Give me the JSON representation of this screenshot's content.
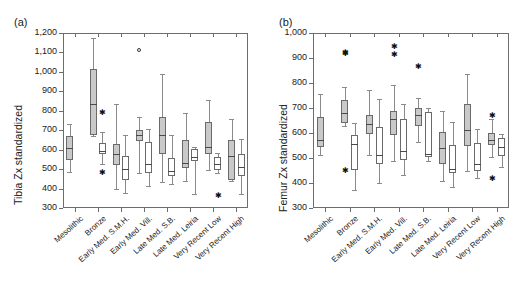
{
  "figure": {
    "panels": [
      {
        "key": "a",
        "label": "(a)",
        "ylabel": "Tibia Zx standardized",
        "ylim": [
          300,
          1200
        ],
        "yticks": [
          300,
          400,
          500,
          600,
          700,
          800,
          900,
          1000,
          1100,
          1200
        ],
        "ytick_labels": [
          "300",
          "400",
          "500",
          "600",
          "700",
          "800",
          "900",
          "1,000",
          "1,100",
          "1,200"
        ],
        "categories": [
          "Mesolithic",
          "Bronze",
          "Early Med. S.M.H.",
          "Early Med. Vill.",
          "Late Med. S.B.",
          "Late Med. Leiria",
          "Very Recent Low",
          "Very Recent High"
        ]
      },
      {
        "key": "b",
        "label": "(b)",
        "ylabel": "Femur Zx standardized",
        "ylim": [
          300,
          1000
        ],
        "yticks": [
          300,
          400,
          500,
          600,
          700,
          800,
          900,
          1000
        ],
        "ytick_labels": [
          "300",
          "400",
          "500",
          "600",
          "700",
          "800",
          "900",
          "1,000"
        ],
        "categories": [
          "Mesolithic",
          "Bronze",
          "Early Med. S.M.H.",
          "Early Med. Vill.",
          "Late Med. S.B.",
          "Late Med. Leiria",
          "Very Recent Low",
          "Very Recent High"
        ]
      }
    ]
  },
  "chart_data": [
    {
      "type": "box",
      "panel": "a",
      "title": "(a)",
      "ylabel": "Tibia Zx standardized",
      "xlabel": "",
      "ylim": [
        300,
        1200
      ],
      "yticks": [
        300,
        400,
        500,
        600,
        700,
        800,
        900,
        1000,
        1100,
        1200
      ],
      "grid": false,
      "legend": "none",
      "categories": [
        "Mesolithic",
        "Bronze",
        "Early Med. S.M.H.",
        "Early Med. Vill.",
        "Late Med. S.B.",
        "Late Med. Leiria",
        "Very Recent Low",
        "Very Recent High"
      ],
      "series": [
        {
          "name": "filled",
          "fill": "#c9c9c9",
          "boxes": [
            {
              "category": "Mesolithic",
              "whisker_low": 484,
              "q1": 546,
              "median": 608,
              "q3": 672,
              "whisker_high": 731,
              "outliers": []
            },
            {
              "category": "Bronze",
              "whisker_low": 672,
              "q1": 674,
              "median": 834,
              "q3": 1013,
              "whisker_high": 1175,
              "outliers": []
            },
            {
              "category": "Early Med. S.M.H.",
              "whisker_low": 399,
              "q1": 519,
              "median": 578,
              "q3": 631,
              "whisker_high": 833,
              "outliers": []
            },
            {
              "category": "Early Med. Vill.",
              "whisker_low": 478,
              "q1": 645,
              "median": 676,
              "q3": 700,
              "whisker_high": 767,
              "outliers": [
                1115
              ]
            },
            {
              "category": "Late Med. S.B.",
              "whisker_low": 432,
              "q1": 577,
              "median": 673,
              "q3": 766,
              "whisker_high": 991,
              "outliers": []
            },
            {
              "category": "Late Med. Leiria",
              "whisker_low": 438,
              "q1": 505,
              "median": 534,
              "q3": 652,
              "whisker_high": 787,
              "outliers": []
            },
            {
              "category": "Very Recent Low",
              "whisker_low": 497,
              "q1": 577,
              "median": 615,
              "q3": 741,
              "whisker_high": 857,
              "outliers": []
            },
            {
              "category": "Very Recent High",
              "whisker_low": 440,
              "q1": 444,
              "median": 569,
              "q3": 648,
              "whisker_high": 758,
              "outliers": []
            }
          ]
        },
        {
          "name": "open",
          "fill": "#ffffff",
          "boxes": [
            {
              "category": "Mesolithic",
              "whisker_low": null,
              "q1": null,
              "median": null,
              "q3": null,
              "whisker_high": null,
              "outliers": []
            },
            {
              "category": "Bronze",
              "whisker_low": 528,
              "q1": 578,
              "median": 592,
              "q3": 634,
              "whisker_high": 692,
              "outliers": [
                789,
                479
              ]
            },
            {
              "category": "Early Med. S.M.H.",
              "whisker_low": 379,
              "q1": 443,
              "median": 499,
              "q3": 567,
              "whisker_high": 677,
              "outliers": []
            },
            {
              "category": "Early Med. Vill.",
              "whisker_low": 413,
              "q1": 478,
              "median": 527,
              "q3": 637,
              "whisker_high": 704,
              "outliers": []
            },
            {
              "category": "Late Med. S.B.",
              "whisker_low": 425,
              "q1": 466,
              "median": 489,
              "q3": 556,
              "whisker_high": 676,
              "outliers": []
            },
            {
              "category": "Late Med. Leiria",
              "whisker_low": 370,
              "q1": 543,
              "median": 560,
              "q3": 601,
              "whisker_high": 612,
              "outliers": []
            },
            {
              "category": "Very Recent Low",
              "whisker_low": 478,
              "q1": 494,
              "median": 528,
              "q3": 563,
              "whisker_high": 584,
              "outliers": [
                364
              ]
            },
            {
              "category": "Very Recent High",
              "whisker_low": 371,
              "q1": 464,
              "median": 509,
              "q3": 576,
              "whisker_high": 657,
              "outliers": []
            }
          ]
        }
      ]
    },
    {
      "type": "box",
      "panel": "b",
      "title": "(b)",
      "ylabel": "Femur Zx standardized",
      "xlabel": "",
      "ylim": [
        300,
        1000
      ],
      "yticks": [
        300,
        400,
        500,
        600,
        700,
        800,
        900,
        1000
      ],
      "grid": false,
      "legend": "none",
      "categories": [
        "Mesolithic",
        "Bronze",
        "Early Med. S.M.H.",
        "Early Med. Vill.",
        "Late Med. S.B.",
        "Late Med. Leiria",
        "Very Recent Low",
        "Very Recent High"
      ],
      "series": [
        {
          "name": "filled",
          "fill": "#c9c9c9",
          "boxes": [
            {
              "category": "Mesolithic",
              "whisker_low": 511,
              "q1": 545,
              "median": 573,
              "q3": 665,
              "whisker_high": 755,
              "outliers": []
            },
            {
              "category": "Bronze",
              "whisker_low": 630,
              "q1": 641,
              "median": 680,
              "q3": 731,
              "whisker_high": 783,
              "outliers": [
                922,
                918,
                447
              ]
            },
            {
              "category": "Early Med. S.M.H.",
              "whisker_low": 511,
              "q1": 597,
              "median": 637,
              "q3": 672,
              "whisker_high": 773,
              "outliers": []
            },
            {
              "category": "Early Med. Vill.",
              "whisker_low": 489,
              "q1": 594,
              "median": 657,
              "q3": 690,
              "whisker_high": 791,
              "outliers": [
                944,
                913
              ]
            },
            {
              "category": "Late Med. S.B.",
              "whisker_low": 565,
              "q1": 629,
              "median": 672,
              "q3": 699,
              "whisker_high": 742,
              "outliers": [
                866
              ]
            },
            {
              "category": "Late Med. Leiria",
              "whisker_low": 410,
              "q1": 478,
              "median": 540,
              "q3": 605,
              "whisker_high": 688,
              "outliers": []
            },
            {
              "category": "Very Recent Low",
              "whisker_low": 450,
              "q1": 548,
              "median": 613,
              "q3": 718,
              "whisker_high": 838,
              "outliers": []
            },
            {
              "category": "Very Recent High",
              "whisker_low": 505,
              "q1": 553,
              "median": 574,
              "q3": 600,
              "whisker_high": 657,
              "outliers": [
                667,
                417
              ]
            }
          ]
        },
        {
          "name": "open",
          "fill": "#ffffff",
          "boxes": [
            {
              "category": "Mesolithic",
              "whisker_low": null,
              "q1": null,
              "median": null,
              "q3": null,
              "whisker_high": null,
              "outliers": []
            },
            {
              "category": "Bronze",
              "whisker_low": 373,
              "q1": 453,
              "median": 557,
              "q3": 593,
              "whisker_high": 640,
              "outliers": []
            },
            {
              "category": "Early Med. S.M.H.",
              "whisker_low": 399,
              "q1": 477,
              "median": 511,
              "q3": 623,
              "whisker_high": 737,
              "outliers": []
            },
            {
              "category": "Early Med. Vill.",
              "whisker_low": 432,
              "q1": 493,
              "median": 529,
              "q3": 657,
              "whisker_high": 717,
              "outliers": []
            },
            {
              "category": "Late Med. S.B.",
              "whisker_low": 488,
              "q1": 506,
              "median": 518,
              "q3": 685,
              "whisker_high": 699,
              "outliers": []
            },
            {
              "category": "Late Med. Leiria",
              "whisker_low": 383,
              "q1": 441,
              "median": 456,
              "q3": 553,
              "whisker_high": 646,
              "outliers": []
            },
            {
              "category": "Very Recent Low",
              "whisker_low": 422,
              "q1": 448,
              "median": 477,
              "q3": 559,
              "whisker_high": 617,
              "outliers": []
            },
            {
              "category": "Very Recent High",
              "whisker_low": 466,
              "q1": 509,
              "median": 543,
              "q3": 581,
              "whisker_high": 597,
              "outliers": []
            }
          ]
        }
      ]
    }
  ]
}
